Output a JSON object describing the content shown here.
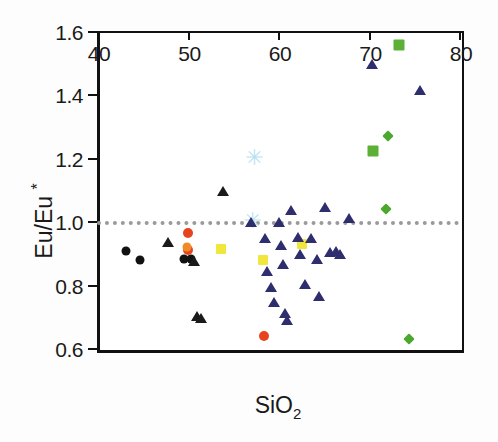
{
  "chart_data": {
    "type": "scatter",
    "title": "",
    "xlabel": "SiO2",
    "xlabel_html": "SiO<sub>2</sub>",
    "ylabel": "Eu/Eu *",
    "ylabel_html": "Eu/Eu <sup>*</sup>",
    "xlim": [
      40,
      80
    ],
    "ylim": [
      0.6,
      1.6
    ],
    "xticks": [
      40,
      50,
      60,
      70,
      80
    ],
    "xtick_labels": [
      "40",
      "50",
      "60",
      "70",
      "80"
    ],
    "yticks": [
      0.6,
      0.8,
      1.0,
      1.2,
      1.4,
      1.6
    ],
    "ytick_labels": [
      "0.6",
      "0.8",
      "1.0",
      "1.2",
      "1.4",
      "1.6"
    ],
    "grid": false,
    "legend": "none",
    "annotations": [
      {
        "name": "reference-line",
        "type": "horizontal-dotted-line",
        "y": 1.0,
        "color": "#9a9a9a",
        "style": "dotted"
      }
    ],
    "series": [
      {
        "name": "black-circles",
        "marker": "circle",
        "color": "#111111",
        "size": 9,
        "points": [
          {
            "x": 43.2,
            "y": 0.905
          },
          {
            "x": 44.7,
            "y": 0.878
          },
          {
            "x": 49.6,
            "y": 0.88
          },
          {
            "x": 50.4,
            "y": 0.882
          }
        ]
      },
      {
        "name": "black-triangles",
        "marker": "triangle",
        "color": "#1a1a1a",
        "size": 11,
        "points": [
          {
            "x": 47.8,
            "y": 0.938
          },
          {
            "x": 50.7,
            "y": 0.878
          },
          {
            "x": 51.0,
            "y": 0.705
          },
          {
            "x": 51.5,
            "y": 0.697
          },
          {
            "x": 53.9,
            "y": 1.098
          }
        ]
      },
      {
        "name": "red-circles",
        "marker": "circle",
        "color": "#e8431f",
        "size": 10,
        "points": [
          {
            "x": 50.1,
            "y": 0.962
          },
          {
            "x": 50.0,
            "y": 0.908
          },
          {
            "x": 58.4,
            "y": 0.637
          }
        ]
      },
      {
        "name": "orange-circles",
        "marker": "circle",
        "color": "#f08a28",
        "size": 9,
        "points": [
          {
            "x": 49.9,
            "y": 0.918
          }
        ]
      },
      {
        "name": "yellow-squares",
        "marker": "square",
        "color": "#f0e63c",
        "size": 10,
        "points": [
          {
            "x": 53.7,
            "y": 0.912
          },
          {
            "x": 58.3,
            "y": 0.878
          },
          {
            "x": 62.7,
            "y": 0.928
          }
        ]
      },
      {
        "name": "light-blue-markers",
        "marker": "star",
        "color": "#b8e2f2",
        "size": 12,
        "points": [
          {
            "x": 57.4,
            "y": 1.2
          },
          {
            "x": 57.2,
            "y": 1.002
          }
        ]
      },
      {
        "name": "navy-triangles",
        "marker": "triangle",
        "color": "#2e2d6e",
        "size": 11,
        "points": [
          {
            "x": 57.0,
            "y": 1.0
          },
          {
            "x": 58.6,
            "y": 0.95
          },
          {
            "x": 58.8,
            "y": 0.845
          },
          {
            "x": 59.2,
            "y": 0.795
          },
          {
            "x": 59.6,
            "y": 0.75
          },
          {
            "x": 60.1,
            "y": 1.0
          },
          {
            "x": 60.3,
            "y": 0.928
          },
          {
            "x": 60.5,
            "y": 0.868
          },
          {
            "x": 60.8,
            "y": 0.715
          },
          {
            "x": 61.0,
            "y": 0.692
          },
          {
            "x": 61.4,
            "y": 1.038
          },
          {
            "x": 62.2,
            "y": 0.955
          },
          {
            "x": 62.4,
            "y": 0.9
          },
          {
            "x": 63.0,
            "y": 0.805
          },
          {
            "x": 63.6,
            "y": 0.952
          },
          {
            "x": 64.3,
            "y": 0.885
          },
          {
            "x": 64.5,
            "y": 0.768
          },
          {
            "x": 65.2,
            "y": 1.048
          },
          {
            "x": 65.7,
            "y": 0.905
          },
          {
            "x": 66.4,
            "y": 0.908
          },
          {
            "x": 66.9,
            "y": 0.9
          },
          {
            "x": 67.8,
            "y": 1.012
          },
          {
            "x": 70.4,
            "y": 1.498
          },
          {
            "x": 75.7,
            "y": 1.418
          }
        ]
      },
      {
        "name": "green-squares",
        "marker": "square",
        "color": "#5cb036",
        "size": 11,
        "points": [
          {
            "x": 73.4,
            "y": 1.557
          },
          {
            "x": 70.5,
            "y": 1.222
          }
        ]
      },
      {
        "name": "green-diamonds",
        "marker": "diamond",
        "color": "#4aa82e",
        "size": 8,
        "points": [
          {
            "x": 72.2,
            "y": 1.27
          },
          {
            "x": 71.9,
            "y": 1.04
          },
          {
            "x": 74.5,
            "y": 0.627
          }
        ]
      }
    ]
  }
}
